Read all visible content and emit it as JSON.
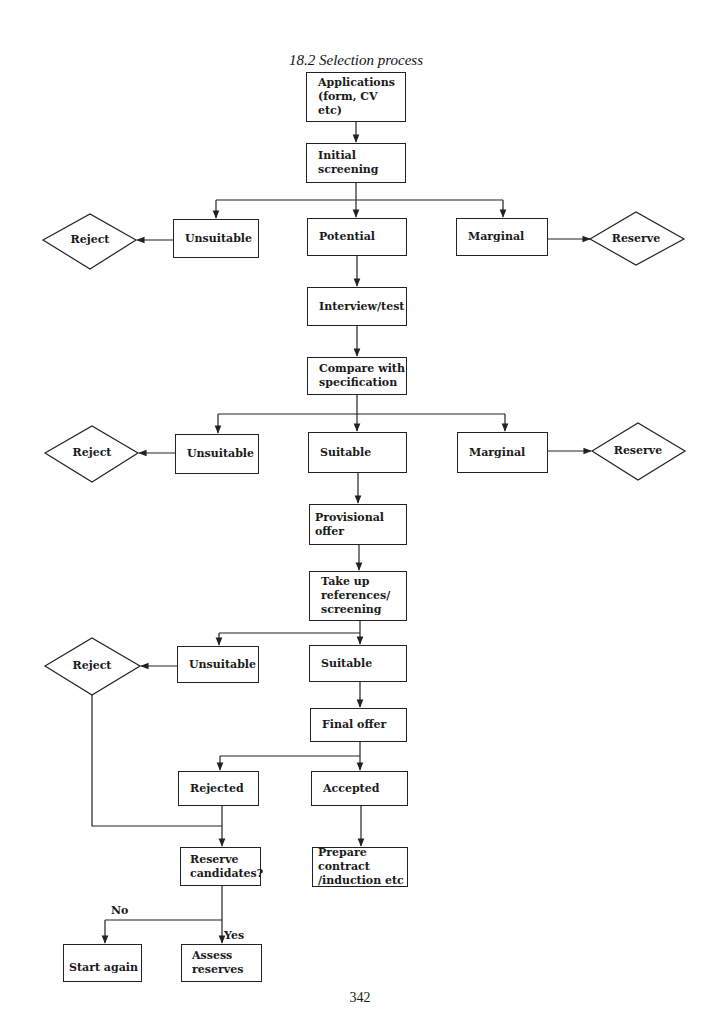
{
  "title": "18.2 Selection process",
  "page_number": "342",
  "colors": {
    "stroke": "#222222",
    "background": "#ffffff",
    "text": "#1a1a1a"
  },
  "nodes": {
    "applications": "Applications\n(form, CV etc)",
    "initial_screening": "Initial\nscreening",
    "unsuitable_1": "Unsuitable",
    "potential": "Potential",
    "marginal_1": "Marginal",
    "reject_1": "Reject",
    "reserve_1": "Reserve",
    "interview_test": "Interview/test",
    "compare_spec": "Compare with\nspecification",
    "unsuitable_2": "Unsuitable",
    "suitable_2": "Suitable",
    "marginal_2": "Marginal",
    "reject_2": "Reject",
    "reserve_2": "Reserve",
    "provisional_offer": "Provisional offer",
    "take_up_refs": "Take up\nreferences/\nscreening",
    "unsuitable_3": "Unsuitable",
    "suitable_3": "Suitable",
    "reject_3": "Reject",
    "final_offer": "Final offer",
    "rejected": "Rejected",
    "accepted": "Accepted",
    "reserve_candidates": "Reserve\ncandidates?",
    "prepare_contract": "Prepare contract\n/induction etc",
    "start_again": "Start again",
    "assess_reserves": "Assess\nreserves"
  },
  "edge_labels": {
    "no": "No",
    "yes": "Yes"
  },
  "edges": [
    [
      "applications",
      "initial_screening"
    ],
    [
      "initial_screening",
      "unsuitable_1"
    ],
    [
      "initial_screening",
      "potential"
    ],
    [
      "initial_screening",
      "marginal_1"
    ],
    [
      "unsuitable_1",
      "reject_1"
    ],
    [
      "marginal_1",
      "reserve_1"
    ],
    [
      "potential",
      "interview_test"
    ],
    [
      "interview_test",
      "compare_spec"
    ],
    [
      "compare_spec",
      "unsuitable_2"
    ],
    [
      "compare_spec",
      "suitable_2"
    ],
    [
      "compare_spec",
      "marginal_2"
    ],
    [
      "unsuitable_2",
      "reject_2"
    ],
    [
      "marginal_2",
      "reserve_2"
    ],
    [
      "suitable_2",
      "provisional_offer"
    ],
    [
      "provisional_offer",
      "take_up_refs"
    ],
    [
      "take_up_refs",
      "unsuitable_3"
    ],
    [
      "take_up_refs",
      "suitable_3"
    ],
    [
      "unsuitable_3",
      "reject_3"
    ],
    [
      "suitable_3",
      "final_offer"
    ],
    [
      "final_offer",
      "rejected"
    ],
    [
      "final_offer",
      "accepted"
    ],
    [
      "reject_3",
      "reserve_candidates"
    ],
    [
      "rejected",
      "reserve_candidates"
    ],
    [
      "accepted",
      "prepare_contract"
    ],
    [
      "reserve_candidates",
      "start_again",
      "No"
    ],
    [
      "reserve_candidates",
      "assess_reserves",
      "Yes"
    ]
  ]
}
